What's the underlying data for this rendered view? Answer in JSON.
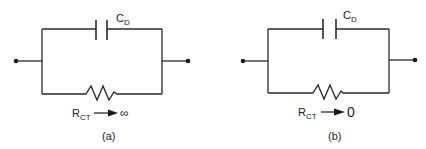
{
  "figure": {
    "circuits": [
      {
        "id": "a",
        "caption": "(a)",
        "capacitor_label_main": "C",
        "capacitor_label_sub": "D",
        "resistor_label_main": "R",
        "resistor_label_sub": "CT",
        "limit_value": "∞"
      },
      {
        "id": "b",
        "caption": "(b)",
        "capacitor_label_main": "C",
        "capacitor_label_sub": "D",
        "resistor_label_main": "R",
        "resistor_label_sub": "CT",
        "limit_value": "0"
      }
    ],
    "colors": {
      "line": "#2a2a2a",
      "background": "#ffffff"
    }
  }
}
